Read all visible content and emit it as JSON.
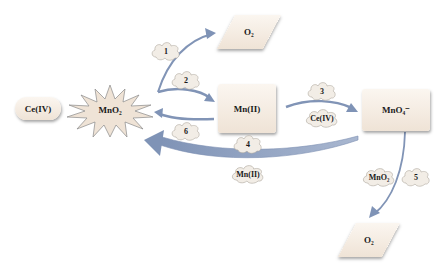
{
  "diagram": {
    "nodes": {
      "ce_iv": {
        "label": "Ce(IV)"
      },
      "mno2": {
        "label": "MnO₂"
      },
      "o2_top": {
        "label": "O₂"
      },
      "mn_ii": {
        "label": "Mn(II)"
      },
      "mno4": {
        "label": "MnO₄⁻"
      },
      "o2_bottom": {
        "label": "O₂"
      }
    },
    "clouds": {
      "step1": {
        "label": "1"
      },
      "step2": {
        "label": "2"
      },
      "step3": {
        "label": "3"
      },
      "step3_reagent": {
        "label": "Ce(IV)"
      },
      "step4": {
        "label": "4"
      },
      "step4_reagent": {
        "label": "Mn(II)"
      },
      "step5": {
        "label": "5"
      },
      "step5_reagent": {
        "label": "MnO₂"
      },
      "step6": {
        "label": "6"
      }
    },
    "colors": {
      "arrow": "#8a9cbc",
      "arrow_dark": "#6f83a8",
      "node_fill": "#f3e9de",
      "star_fill": "#efe3d6",
      "star_stroke": "#8a8a8a"
    }
  }
}
